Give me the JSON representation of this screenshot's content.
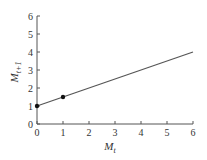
{
  "chart_data": {
    "type": "line",
    "title": "",
    "xlabel": "M",
    "xlabel_subscript": "t",
    "ylabel": "M",
    "ylabel_subscript": "t+1",
    "xlim": [
      0,
      6
    ],
    "ylim": [
      0,
      6
    ],
    "x_ticks": [
      "0",
      "1",
      "2",
      "3",
      "4",
      "5",
      "6"
    ],
    "y_ticks": [
      "0",
      "1",
      "2",
      "3",
      "4",
      "5",
      "6"
    ],
    "grid": false,
    "legend": "none",
    "series": [
      {
        "name": "line",
        "x": [
          0,
          6
        ],
        "y": [
          1,
          4
        ],
        "color": "#555555"
      }
    ],
    "points": [
      {
        "x": 0,
        "y": 1
      },
      {
        "x": 1,
        "y": 1.5
      }
    ]
  },
  "colors": {
    "axis": "#555555",
    "line": "#555555",
    "point": "#111111"
  }
}
